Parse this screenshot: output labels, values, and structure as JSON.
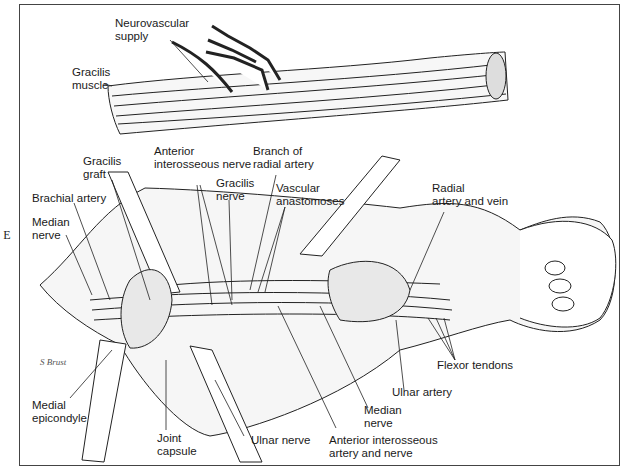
{
  "figure": {
    "panel_letter": "E",
    "signature": "S Brust",
    "top_illustration": {
      "labels": {
        "neurovascular_supply": "Neurovascular\nsupply",
        "gracilis_muscle": "Gracilis\nmuscle"
      }
    },
    "bottom_illustration": {
      "labels": {
        "gracilis_graft": "Gracilis\ngraft",
        "anterior_interosseous_nerve": "Anterior\ninterosseous nerve",
        "branch_of_radial_artery": "Branch of\nradial artery",
        "gracilis_nerve": "Gracilis\nnerve",
        "vascular_anastomoses": "Vascular\nanastomoses",
        "brachial_artery": "Brachial artery",
        "median_nerve_left": "Median\nnerve",
        "radial_artery_and_vein": "Radial\nartery and vein",
        "flexor_tendons": "Flexor tendons",
        "ulnar_artery": "Ulnar artery",
        "median_nerve_bottom": "Median\nnerve",
        "medial_epicondyle": "Medial\nepicondyle",
        "joint_capsule": "Joint\ncapsule",
        "ulnar_nerve": "Ulnar nerve",
        "anterior_interosseous_artery_and_nerve": "Anterior interosseous\nartery and nerve"
      }
    },
    "colors": {
      "ink": "#1a1a1a",
      "background": "#ffffff",
      "frame": "#444444"
    }
  }
}
